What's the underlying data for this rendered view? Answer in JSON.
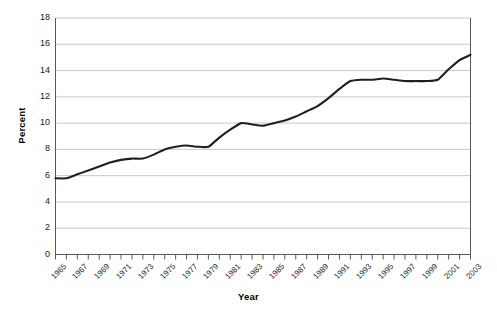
{
  "chart_data": {
    "type": "line",
    "title": "",
    "xlabel": "Year",
    "ylabel": "Percent",
    "xlim": [
      1965,
      2003
    ],
    "ylim": [
      0,
      18
    ],
    "ytick_step": 2,
    "yticks": [
      0,
      2,
      4,
      6,
      8,
      10,
      12,
      14,
      16,
      18
    ],
    "xtick_labels": [
      "1965",
      "1967",
      "1969",
      "1971",
      "1973",
      "1975",
      "1977",
      "1979",
      "1981",
      "1983",
      "1985",
      "1987",
      "1989",
      "1991",
      "1993",
      "1995",
      "1997",
      "1999",
      "2001",
      "2003"
    ],
    "xtick_step": 2,
    "xticks_minor_every": 1,
    "grid": "horizontal",
    "legend": "none",
    "line_color": "#231f20",
    "line_width": 2.1,
    "gridline_color": "#c9c9c9",
    "axis_color": "#58595b",
    "background": "#ffffff",
    "x": [
      1965,
      1966,
      1967,
      1968,
      1969,
      1970,
      1971,
      1972,
      1973,
      1974,
      1975,
      1976,
      1977,
      1978,
      1979,
      1980,
      1981,
      1982,
      1983,
      1984,
      1985,
      1986,
      1987,
      1988,
      1989,
      1990,
      1991,
      1992,
      1993,
      1994,
      1995,
      1996,
      1997,
      1998,
      1999,
      2000,
      2001,
      2002,
      2003
    ],
    "series": [
      {
        "name": "Percent",
        "values": [
          5.8,
          5.8,
          6.1,
          6.4,
          6.7,
          7.0,
          7.2,
          7.3,
          7.3,
          7.6,
          8.0,
          8.2,
          8.3,
          8.2,
          8.2,
          8.9,
          9.5,
          10.0,
          9.9,
          9.8,
          10.0,
          10.2,
          10.5,
          10.9,
          11.3,
          11.9,
          12.6,
          13.2,
          13.3,
          13.3,
          13.4,
          13.3,
          13.2,
          13.2,
          13.2,
          13.3,
          14.1,
          14.8,
          15.2
        ]
      }
    ]
  }
}
